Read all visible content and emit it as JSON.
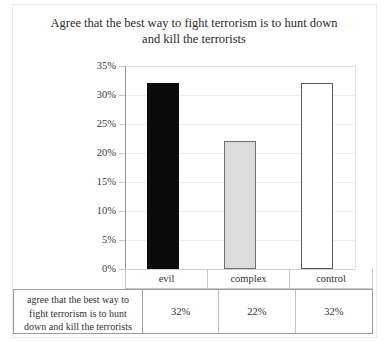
{
  "chart_data": {
    "type": "bar",
    "title": "Agree that the best way to fight terrorism is to hunt down and kill the terrorists",
    "title_line1": "Agree that the best way to fight terrorism is to hunt down",
    "title_line2": "and kill the terrorists",
    "xlabel": "",
    "ylabel": "",
    "categories": [
      "evil",
      "complex",
      "control"
    ],
    "values": [
      32,
      22,
      32
    ],
    "value_labels": [
      "32%",
      "22%",
      "32%"
    ],
    "ylim": [
      0,
      35
    ],
    "ytick_labels": [
      "35%",
      "30%",
      "25%",
      "20%",
      "15%",
      "10%",
      "5%",
      "0%"
    ],
    "ytick_values": [
      35,
      30,
      25,
      20,
      15,
      10,
      5,
      0
    ],
    "grid": true,
    "legend": false,
    "series": [
      {
        "name": "agree that the best way to fight terrorism is to hunt down and kill the terrorists",
        "values": [
          32,
          22,
          32
        ],
        "bar_colors": [
          "#0b0b0b",
          "#dcdcdc",
          "#ffffff"
        ],
        "bar_border_colors": [
          "#0b0b0b",
          "#6e6e6e",
          "#5c5c5c"
        ]
      }
    ]
  },
  "table": {
    "row_header": "agree that the best way to fight terrorism is to hunt down and kill the terrorists",
    "row_header_line1": "agree that the best way to",
    "row_header_line2": "fight terrorism is to hunt",
    "row_header_line3": "down and kill the terrorists",
    "columns": [
      "evil",
      "complex",
      "control"
    ],
    "values": [
      "32%",
      "22%",
      "32%"
    ]
  }
}
